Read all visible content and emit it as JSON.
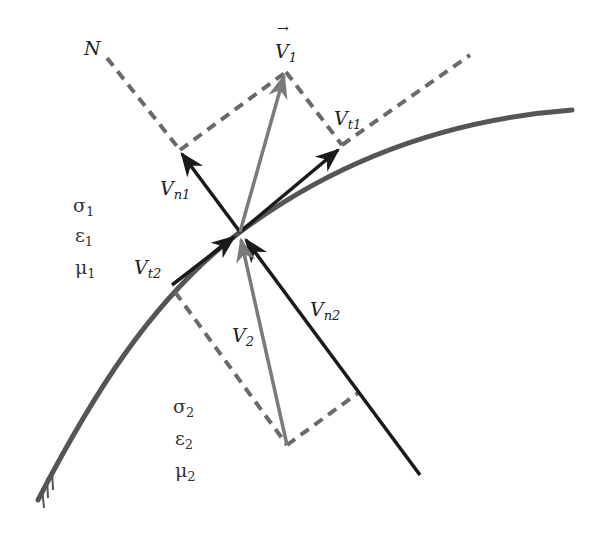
{
  "figure": {
    "colors": {
      "interface_curve": "#555555",
      "black_vectors": "#1a1a1a",
      "gray_vectors": "#7a7a7a",
      "dashed_lines": "#6a6a6a"
    }
  },
  "labels": {
    "normal_axis": "N",
    "v1_main": "V",
    "v1_sub": "1",
    "v1_arrow": "→",
    "vt1_main": "V",
    "vt1_sub": "t1",
    "vn1_main": "V",
    "vn1_sub": "n1",
    "vt2_main": "V",
    "vt2_sub": "t2",
    "vn2_main": "V",
    "vn2_sub": "n2",
    "v2_main": "V",
    "v2_sub": "2"
  },
  "medium1": {
    "sigma": "σ",
    "sigma_sub": "1",
    "epsilon": "ε",
    "epsilon_sub": "1",
    "mu": "μ",
    "mu_sub": "1"
  },
  "medium2": {
    "sigma": "σ",
    "sigma_sub": "2",
    "epsilon": "ε",
    "epsilon_sub": "2",
    "mu": "μ",
    "mu_sub": "2"
  }
}
